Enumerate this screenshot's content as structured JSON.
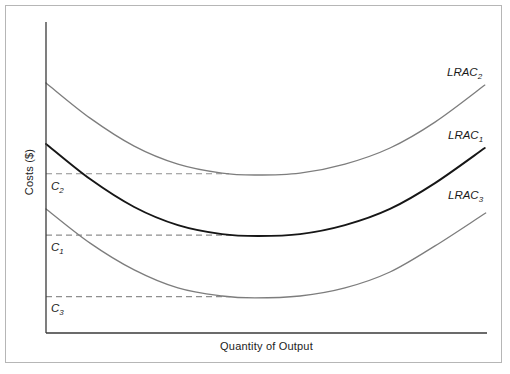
{
  "figure": {
    "background": "#ffffff",
    "border_color": "#b6b6b6",
    "axis_color": "#3a3a3a"
  },
  "chart_data": {
    "type": "line",
    "title": "",
    "xlabel": "Quantity of Output",
    "ylabel": "Costs ($)",
    "xlim": [
      0,
      100
    ],
    "ylim": [
      0,
      100
    ],
    "grid": false,
    "legend": "inline curve labels at right end of each curve",
    "series": [
      {
        "name": "LRAC2",
        "label_main": "LRAC",
        "label_sub": "2",
        "color": "#7d7d7d",
        "width": 1.3,
        "points": [
          [
            0,
            80.4
          ],
          [
            10,
            69.1
          ],
          [
            20,
            60.1
          ],
          [
            29.9,
            54.3
          ],
          [
            39.9,
            51.4
          ],
          [
            47.4,
            50.8
          ],
          [
            57.6,
            51.4
          ],
          [
            67.8,
            54.3
          ],
          [
            78,
            59.5
          ],
          [
            88.2,
            67.8
          ],
          [
            99.5,
            79.7
          ]
        ]
      },
      {
        "name": "LRAC1",
        "label_main": "LRAC",
        "label_sub": "1",
        "color": "#161616",
        "width": 1.9,
        "points": [
          [
            0,
            60.8
          ],
          [
            10,
            49.5
          ],
          [
            20,
            40.5
          ],
          [
            29.9,
            34.7
          ],
          [
            39.9,
            31.8
          ],
          [
            48.1,
            31.2
          ],
          [
            57.6,
            31.8
          ],
          [
            67.8,
            34.7
          ],
          [
            78,
            39.9
          ],
          [
            88.2,
            48.2
          ],
          [
            99.5,
            59.5
          ]
        ]
      },
      {
        "name": "LRAC3",
        "label_main": "LRAC",
        "label_sub": "3",
        "color": "#7d7d7d",
        "width": 1.3,
        "points": [
          [
            0,
            39.9
          ],
          [
            10,
            28.9
          ],
          [
            20,
            20.3
          ],
          [
            29.9,
            14.5
          ],
          [
            39.9,
            11.9
          ],
          [
            47.4,
            11.3
          ],
          [
            57.6,
            11.9
          ],
          [
            67.8,
            14.5
          ],
          [
            78,
            19.6
          ],
          [
            88.2,
            28
          ],
          [
            99.7,
            38.6
          ]
        ]
      }
    ],
    "reference_lines": [
      {
        "name": "C2",
        "label_main": "C",
        "label_sub": "2",
        "y": 51.2,
        "x_start": 0,
        "x_end": 41.5,
        "style": "dashed",
        "color": "#8f8f8f"
      },
      {
        "name": "C1",
        "label_main": "C",
        "label_sub": "1",
        "y": 31.5,
        "x_start": 0,
        "x_end": 42.0,
        "style": "dashed",
        "color": "#8f8f8f"
      },
      {
        "name": "C3",
        "label_main": "C",
        "label_sub": "3",
        "y": 11.7,
        "x_start": 0,
        "x_end": 41.8,
        "style": "dashed",
        "color": "#8f8f8f"
      }
    ]
  }
}
